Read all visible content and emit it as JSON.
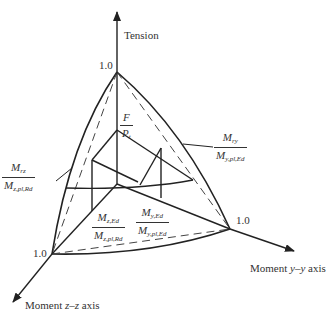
{
  "diagram": {
    "axes": {
      "tension": {
        "label": "Tension",
        "tick": "1.0"
      },
      "moment_y": {
        "label_prefix": "Moment ",
        "label_var": "y–y",
        "label_suffix": " axis",
        "tick": "1.0"
      },
      "moment_z": {
        "label_prefix": "Moment ",
        "label_var": "z–z",
        "label_suffix": " axis",
        "tick": "1.0"
      }
    },
    "fractions": {
      "force": {
        "num": "F",
        "den_main": "P",
        "den_sub": "t"
      },
      "mry": {
        "num_main": "M",
        "num_sub": "ry",
        "den_main": "M",
        "den_sub": "y,pl,Ed"
      },
      "mrz": {
        "num_main": "M",
        "num_sub": "rz",
        "den_main": "M",
        "den_sub": "z,pl,Rd"
      },
      "mz_ed": {
        "num_main": "M",
        "num_sub": "z,Ed",
        "den_main": "M",
        "den_sub": "z,pl,Rd"
      },
      "my_ed": {
        "num_main": "M",
        "num_sub": "y,Ed",
        "den_main": "M",
        "den_sub": "y,pl,Ed"
      }
    },
    "colors": {
      "line": "#222222",
      "text": "#333333",
      "background": "#ffffff"
    }
  }
}
